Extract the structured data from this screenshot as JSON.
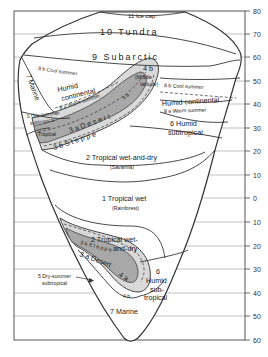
{
  "diagram": {
    "axis": {
      "side": "right",
      "ticks": [
        {
          "label": "80",
          "y": 11
        },
        {
          "label": "70",
          "y": 34
        },
        {
          "label": "60",
          "y": 57
        },
        {
          "label": "50",
          "y": 81
        },
        {
          "label": "40",
          "y": 104
        },
        {
          "label": "30",
          "y": 128
        },
        {
          "label": "20",
          "y": 151
        },
        {
          "label": "10",
          "y": 175
        },
        {
          "label": "0",
          "y": 198
        },
        {
          "label": "10",
          "y": 222
        },
        {
          "label": "20",
          "y": 246
        },
        {
          "label": "30",
          "y": 269
        },
        {
          "label": "40",
          "y": 293
        },
        {
          "label": "50",
          "y": 316
        },
        {
          "label": "60",
          "y": 340
        }
      ]
    },
    "colors": {
      "line": "#333333",
      "steppe_fill": "#d9d9d9",
      "desert_fill": "#a8a8a8",
      "background": "#ffffff"
    },
    "regions": {
      "ice_cap": "11 Ice cap",
      "tundra": "10 Tundra",
      "subarctic": "9 Subarctic",
      "marine_north": "7 Marine",
      "cool_summer_w": "8 b Cool summer",
      "humid_cont_w_1": "Humid",
      "humid_cont_w_2": "continental",
      "warm_summer_w": "8 a Warm summer",
      "highland_4b_n": "4 b",
      "middle_lat_1": "(Middle",
      "middle_lat_2": "latitude)",
      "desert_4a_n": "4 a",
      "cool_summer_e": "8 b Cool summer",
      "humid_cont_e": "Humid continental",
      "warm_summer_e": "8 a Warm summer",
      "dry_summer_n_1": "5 Dry-summer",
      "dry_summer_n_2": "subtropical",
      "tropical_desert": "(Tropical",
      "desert_3a_n": "3 a  D e s e r t",
      "steppe_3b_n": "3 b  S  t  e  p  p  e",
      "humid_sub_n_1": "6  Humid",
      "humid_sub_n_2": "subtropical",
      "savanna_n_1": "2  Tropical wet-and-dry",
      "savanna_n_2": "(Savanna)",
      "rainforest_1": "1  Tropical wet",
      "rainforest_2": "(Rainforest)",
      "savanna_s_1": "2  Tropical wet-",
      "savanna_s_2": "and-dry",
      "steppe_3b_s": "3 b  S t e p p e",
      "desert_3a_s": "3 a  Desert",
      "desert_4a_s": "4 a",
      "highland_4b_s": "4 b",
      "dry_summer_s_1": "5 Dry-summer",
      "dry_summer_s_2": "subtropical",
      "humid_sub_s_1": "6",
      "humid_sub_s_2": "Humid",
      "humid_sub_s_3": "sub-",
      "humid_sub_s_4": "tropical",
      "marine_south": "7  Marine"
    }
  }
}
